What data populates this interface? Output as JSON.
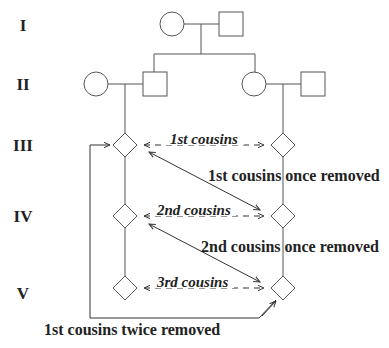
{
  "diagram": {
    "type": "pedigree-chart",
    "generations": [
      {
        "label": "I"
      },
      {
        "label": "II"
      },
      {
        "label": "III"
      },
      {
        "label": "IV"
      },
      {
        "label": "V"
      }
    ],
    "same_generation_relations": [
      {
        "label": "1st cousins",
        "generation": "III"
      },
      {
        "label": "2nd cousins",
        "generation": "IV"
      },
      {
        "label": "3rd cousins",
        "generation": "V"
      }
    ],
    "cross_generation_relations": [
      {
        "label": "1st cousins once removed",
        "from": "III",
        "to": "IV"
      },
      {
        "label": "2nd cousins once removed",
        "from": "IV",
        "to": "V"
      },
      {
        "label": "1st cousins twice removed",
        "from": "III",
        "to": "V"
      }
    ],
    "symbols": {
      "female": "circle",
      "male": "square",
      "unspecified": "diamond"
    },
    "colors": {
      "line": "#555555",
      "text": "#222222",
      "background": "#ffffff"
    }
  }
}
